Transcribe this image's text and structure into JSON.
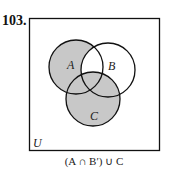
{
  "problem": {
    "number": "103."
  },
  "diagram": {
    "universe_label": "U",
    "sets": [
      {
        "label": "A",
        "cx": 76,
        "cy": 67,
        "r": 27
      },
      {
        "label": "B",
        "cx": 108,
        "cy": 70,
        "r": 27
      },
      {
        "label": "C",
        "cx": 93,
        "cy": 99,
        "r": 27
      }
    ],
    "shaded_expression": "(A ∩ B′) ∪ C",
    "colors": {
      "shade": "#c8c8c8",
      "stroke": "#111111",
      "background": "#ffffff"
    }
  }
}
